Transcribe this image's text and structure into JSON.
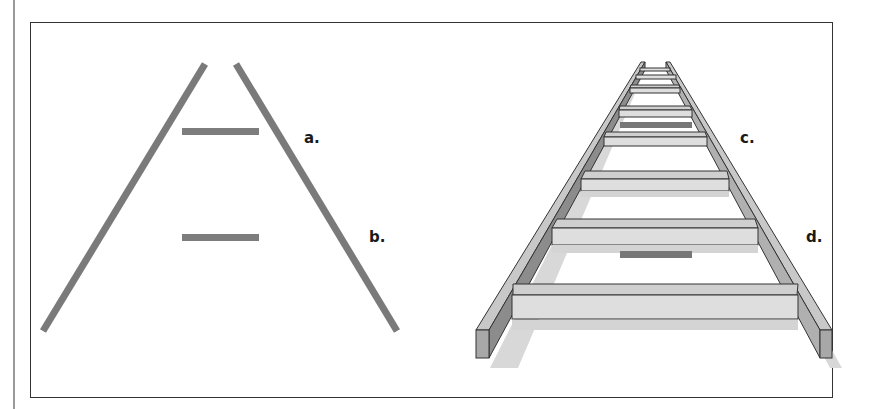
{
  "figure": {
    "left_panel": {
      "description": "flat diagram of ladder: two converging rails with two rungs",
      "labels": {
        "a": "a.",
        "b": "b."
      }
    },
    "right_panel": {
      "description": "3D perspective ladder receding into distance",
      "labels": {
        "c": "c.",
        "d": "d."
      }
    }
  },
  "colors": {
    "rail": "#7a7a7a",
    "rung_flat": "#7d7d7d",
    "wood_light": "#dedede",
    "wood_mid": "#c4c4c4",
    "wood_dark": "#8c8c8c",
    "shadow": "#d4d4d4",
    "outline": "#333333",
    "highlight_bar": "#777777"
  }
}
